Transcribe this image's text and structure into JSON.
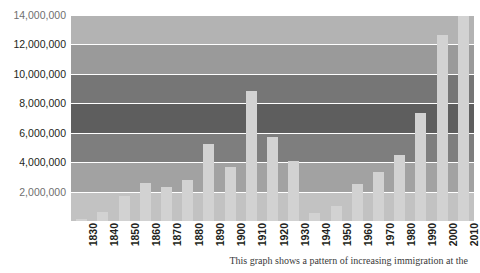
{
  "chart_data": {
    "type": "bar",
    "title": "",
    "xlabel": "",
    "ylabel": "",
    "categories": [
      "1830",
      "1840",
      "1850",
      "1860",
      "1870",
      "1880",
      "1890",
      "1900",
      "1910",
      "1920",
      "1930",
      "1940",
      "1950",
      "1960",
      "1970",
      "1980",
      "1990",
      "2000",
      "2010"
    ],
    "values": [
      143439,
      599125,
      1713251,
      2598214,
      2314824,
      2812191,
      5246613,
      3687564,
      8795386,
      5735811,
      4107209,
      528431,
      1035039,
      2515479,
      3321677,
      4493314,
      7338062,
      12600000,
      13900000
    ],
    "ylim": [
      0,
      15000000
    ],
    "ytick_labels": [
      "2,000,000",
      "4,000,000",
      "6,000,000",
      "8,000,000",
      "10,000,000",
      "12,000,000",
      "14,000,000"
    ],
    "ytick_values": [
      2000000,
      4000000,
      6000000,
      8000000,
      10000000,
      12000000,
      14000000
    ],
    "grid": true,
    "legend": "none",
    "bar_color": "#d2d2d2",
    "gridline_color": "#ffffff",
    "background_bands": [
      {
        "from": 14000000,
        "to": 15000000,
        "color": "#ffffff"
      },
      {
        "from": 12000000,
        "to": 14000000,
        "color": "#b3b3b3"
      },
      {
        "from": 10000000,
        "to": 12000000,
        "color": "#9a9a9a"
      },
      {
        "from": 8000000,
        "to": 10000000,
        "color": "#767676"
      },
      {
        "from": 6000000,
        "to": 8000000,
        "color": "#5e5e5e"
      },
      {
        "from": 4000000,
        "to": 6000000,
        "color": "#7e7e7e"
      },
      {
        "from": 2000000,
        "to": 4000000,
        "color": "#a2a2a2"
      },
      {
        "from": 0,
        "to": 2000000,
        "color": "#c2c2c2"
      }
    ]
  },
  "caption": {
    "text": "This graph shows a pattern of increasing immigration at the"
  }
}
